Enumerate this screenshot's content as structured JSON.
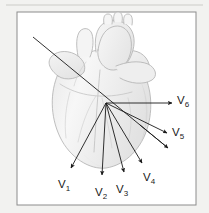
{
  "figure": {
    "kind": "anatomical-diagram",
    "page_background": "#f2f2f0",
    "panel_background": "#ffffff",
    "frame_color": "#8c8c8c",
    "vector_color": "#1a1a1a",
    "heart_line_color": "#b4b4b4",
    "heart_shade_color": "#dcdcdc",
    "label_color": "#1a1a1a"
  },
  "frame": {
    "x": 17,
    "y": 12,
    "width": 179,
    "height": 193
  },
  "top_rule": {
    "x1": 6,
    "y1": 5,
    "x2": 203,
    "y2": 5,
    "color": "#d8d8d6"
  },
  "origin": {
    "x": 106,
    "y": 103
  },
  "axis_line": {
    "name": "electrical-axis-line",
    "x1": 33,
    "y1": 37,
    "x2": 168,
    "y2": 148
  },
  "vectors": [
    {
      "id": "v1",
      "label": "V",
      "subscript": "1",
      "tip_x": 71,
      "tip_y": 168,
      "label_x": 58,
      "label_y": 188
    },
    {
      "id": "v2",
      "label": "V",
      "subscript": "2",
      "tip_x": 102,
      "tip_y": 175,
      "label_x": 95,
      "label_y": 196
    },
    {
      "id": "v3",
      "label": "V",
      "subscript": "3",
      "tip_x": 124,
      "tip_y": 172,
      "label_x": 116,
      "label_y": 193
    },
    {
      "id": "v4",
      "label": "V",
      "subscript": "4",
      "tip_x": 142,
      "tip_y": 163,
      "label_x": 143,
      "label_y": 181
    },
    {
      "id": "v5",
      "label": "V",
      "subscript": "5",
      "tip_x": 167,
      "tip_y": 133,
      "label_x": 172,
      "label_y": 136
    },
    {
      "id": "v6",
      "label": "V",
      "subscript": "6",
      "tip_x": 172,
      "tip_y": 103,
      "label_x": 177,
      "label_y": 104
    }
  ]
}
